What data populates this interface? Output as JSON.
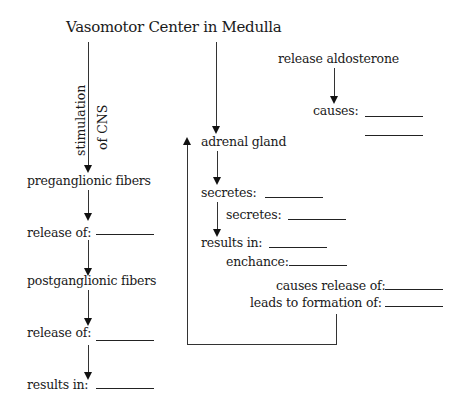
{
  "title": "Vasomotor Center in Medulla",
  "left_chain": {
    "edge_label_line1": "stimulation",
    "edge_label_line2": "of CNS",
    "preganglionic": "preganglionic fibers",
    "release_of_1": "release of:",
    "postganglionic": "postganglionic fibers",
    "release_of_2": "release of:",
    "results_in": "results in:"
  },
  "middle_chain": {
    "adrenal_gland": "adrenal gland",
    "secretes_1": "secretes:",
    "secretes_2": "secretes:",
    "results_in": "results in:",
    "enchance": "enchance:",
    "causes_release_of": "causes release of:",
    "leads_to_formation_of": "leads to formation of:"
  },
  "right_chain": {
    "release_aldosterone": "release aldosterone",
    "causes": "causes:"
  },
  "colors": {
    "ink": "#1a1a1a",
    "background": "#ffffff"
  }
}
